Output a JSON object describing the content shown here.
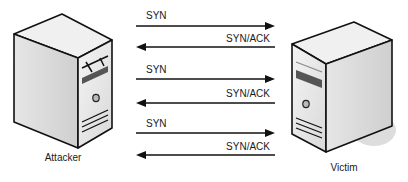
{
  "nodes": {
    "attacker": {
      "label": "Attacker"
    },
    "victim": {
      "label": "Victim"
    }
  },
  "messages": [
    {
      "label": "SYN",
      "direction": "attacker-to-victim"
    },
    {
      "label": "SYN/ACK",
      "direction": "victim-to-attacker"
    },
    {
      "label": "SYN",
      "direction": "attacker-to-victim"
    },
    {
      "label": "SYN/ACK",
      "direction": "victim-to-attacker"
    },
    {
      "label": "SYN",
      "direction": "attacker-to-victim"
    },
    {
      "label": "SYN/ACK",
      "direction": "victim-to-attacker"
    }
  ]
}
